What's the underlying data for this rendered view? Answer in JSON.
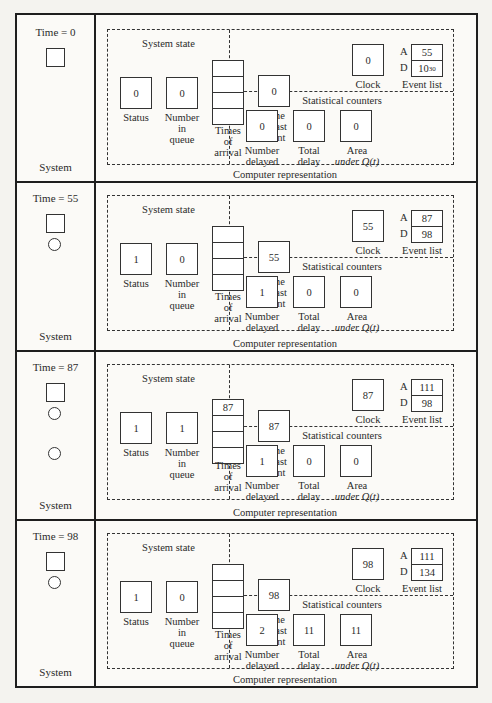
{
  "labels": {
    "system": "System",
    "system_state": "System state",
    "status": "Status",
    "number_in_queue": [
      "Number",
      "in",
      "queue"
    ],
    "times_of_arrival": [
      "Times",
      "of",
      "arrival"
    ],
    "time_of_last_event": [
      "Time",
      "of last",
      "event"
    ],
    "clock": "Clock",
    "event_list": "Event list",
    "event_A": "A",
    "event_D": "D",
    "statistical_counters": "Statistical counters",
    "number_delayed": [
      "Number",
      "delayed"
    ],
    "total_delay": [
      "Total",
      "delay"
    ],
    "area_under": [
      "Area",
      "under Q(t)"
    ],
    "computer_representation": "Computer representation"
  },
  "panels": [
    {
      "time_label": "Time = 0",
      "server_busy": false,
      "queue_customers": 0,
      "status": "0",
      "number_in_queue": "0",
      "times_of_arrival": [
        "",
        "",
        "",
        ""
      ],
      "time_of_last_event": "0",
      "clock": "0",
      "event_A": "55",
      "event_D": "10",
      "event_D_exp": "30",
      "number_delayed": "0",
      "total_delay": "0",
      "area_under_q": "0"
    },
    {
      "time_label": "Time = 55",
      "server_busy": true,
      "queue_customers": 0,
      "status": "1",
      "number_in_queue": "0",
      "times_of_arrival": [
        "",
        "",
        "",
        ""
      ],
      "time_of_last_event": "55",
      "clock": "55",
      "event_A": "87",
      "event_D": "98",
      "event_D_exp": "",
      "number_delayed": "1",
      "total_delay": "0",
      "area_under_q": "0"
    },
    {
      "time_label": "Time = 87",
      "server_busy": true,
      "queue_customers": 1,
      "status": "1",
      "number_in_queue": "1",
      "times_of_arrival": [
        "87",
        "",
        "",
        ""
      ],
      "time_of_last_event": "87",
      "clock": "87",
      "event_A": "111",
      "event_D": "98",
      "event_D_exp": "",
      "number_delayed": "1",
      "total_delay": "0",
      "area_under_q": "0"
    },
    {
      "time_label": "Time = 98",
      "server_busy": true,
      "queue_customers": 0,
      "status": "1",
      "number_in_queue": "0",
      "times_of_arrival": [
        "",
        "",
        "",
        ""
      ],
      "time_of_last_event": "98",
      "clock": "98",
      "event_A": "111",
      "event_D": "134",
      "event_D_exp": "",
      "number_delayed": "2",
      "total_delay": "11",
      "area_under_q": "11"
    }
  ]
}
